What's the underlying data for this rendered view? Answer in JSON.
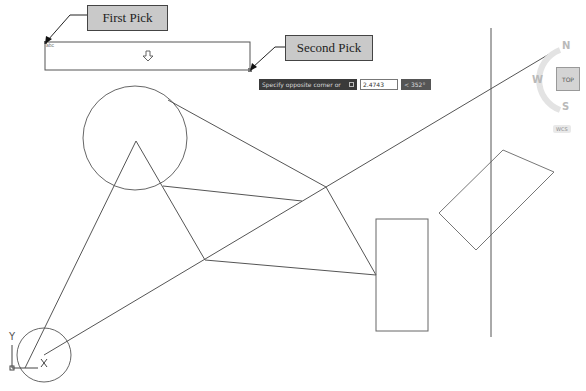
{
  "callouts": {
    "first_pick": "First Pick",
    "second_pick": "Second Pick"
  },
  "dynamic_input": {
    "prompt": "Specify opposite corner or",
    "distance_value": "2.4743",
    "angle_value": "< 352°"
  },
  "viewcube": {
    "face": "TOP",
    "north": "N",
    "west": "W",
    "south": "S",
    "coordinate_system": "WCS"
  },
  "ucs_icon": {
    "x_label": "X",
    "y_label": "Y"
  },
  "selection_box_grip_label": "abc",
  "colors": {
    "drawing_lines": "#555555",
    "callout_fill": "#c9c9c9",
    "dynamic_prompt_bg": "#3a3a3a"
  }
}
